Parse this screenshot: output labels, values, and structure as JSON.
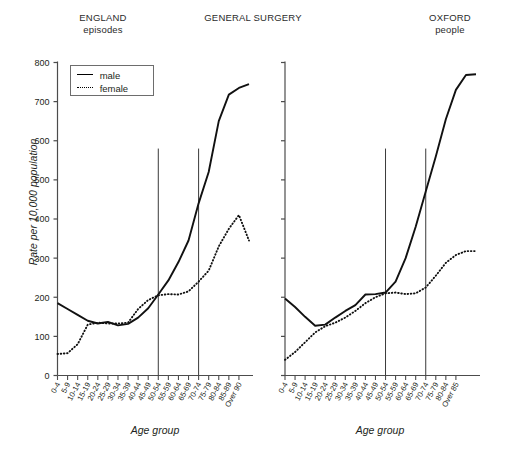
{
  "header": {
    "left_line1": "ENGLAND",
    "left_line2": "episodes",
    "center": "GENERAL SURGERY",
    "right_line1": "OXFORD",
    "right_line2": "people"
  },
  "legend": {
    "male_label": "male",
    "female_label": "female",
    "male_key": "solid-line-icon",
    "female_key": "dotted-line-icon"
  },
  "axis": {
    "y_title": "Rate per 10,000 population",
    "x_title": "Age group",
    "y_ticks": [
      "0",
      "100",
      "200",
      "300",
      "400",
      "500",
      "600",
      "700",
      "800"
    ]
  },
  "chart_data": [
    {
      "type": "line",
      "title": "ENGLAND episodes",
      "panel": "left",
      "xlabel": "Age group",
      "ylabel": "Rate per 10,000 population",
      "ylim": [
        0,
        800
      ],
      "grid": false,
      "legend_position": "top-left",
      "categories": [
        "0-4",
        "5-9",
        "10-14",
        "15-19",
        "20-24",
        "25-29",
        "30-34",
        "35-39",
        "40-44",
        "45-49",
        "50-54",
        "55-59",
        "60-64",
        "65-69",
        "70-74",
        "75-79",
        "80-84",
        "85-89",
        "Over 90"
      ],
      "series": [
        {
          "name": "male",
          "style": "solid",
          "values": [
            185,
            170,
            155,
            140,
            133,
            137,
            128,
            132,
            148,
            172,
            207,
            243,
            290,
            345,
            440,
            520,
            650,
            718,
            735,
            745
          ]
        },
        {
          "name": "female",
          "style": "dotted",
          "values": [
            55,
            57,
            80,
            130,
            135,
            133,
            133,
            135,
            170,
            193,
            205,
            208,
            207,
            215,
            240,
            268,
            330,
            375,
            410,
            345
          ]
        }
      ],
      "reference_lines": [
        {
          "at_category": "50-54",
          "from_value": 0,
          "to_value": 580
        },
        {
          "at_category": "70-74",
          "from_value": 0,
          "to_value": 580
        }
      ]
    },
    {
      "type": "line",
      "title": "OXFORD people",
      "panel": "right",
      "xlabel": "Age group",
      "ylabel": "Rate per 10,000 population",
      "ylim": [
        0,
        800
      ],
      "grid": false,
      "legend_position": "none",
      "categories": [
        "0-4",
        "5-9",
        "10-14",
        "15-19",
        "20-24",
        "25-29",
        "30-34",
        "35-39",
        "40-44",
        "45-49",
        "50-54",
        "55-59",
        "60-64",
        "65-69",
        "70-74",
        "75-79",
        "80-84",
        "Over 85"
      ],
      "series": [
        {
          "name": "male",
          "style": "solid",
          "values": [
            197,
            175,
            150,
            127,
            130,
            148,
            165,
            180,
            207,
            208,
            212,
            240,
            300,
            380,
            470,
            560,
            655,
            730,
            768,
            770
          ]
        },
        {
          "name": "female",
          "style": "dotted",
          "values": [
            40,
            60,
            85,
            110,
            126,
            135,
            148,
            165,
            185,
            200,
            210,
            212,
            208,
            210,
            225,
            255,
            288,
            308,
            318,
            318
          ]
        }
      ],
      "reference_lines": [
        {
          "at_category": "50-54",
          "from_value": 0,
          "to_value": 580
        },
        {
          "at_category": "70-74",
          "from_value": 0,
          "to_value": 580
        }
      ]
    }
  ]
}
